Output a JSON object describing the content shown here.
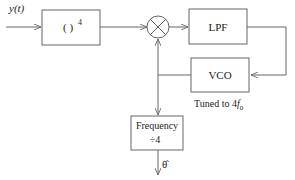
{
  "diagram": {
    "input_label": "y(t)",
    "blocks": {
      "power": {
        "label": "( )",
        "superscript": "4"
      },
      "lpf": {
        "label": "LPF"
      },
      "vco": {
        "label": "VCO",
        "note_prefix": "Tuned to 4",
        "note_f": "f",
        "note_sub": "0"
      },
      "divider": {
        "line1": "Frequency",
        "line2": "÷4"
      }
    },
    "multiplier_symbol": "×",
    "output_label": "θ̂",
    "colors": {
      "line": "#666666",
      "box": "#666666",
      "text": "#222222"
    }
  }
}
